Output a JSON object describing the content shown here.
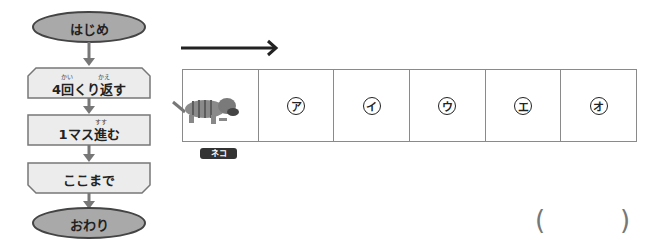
{
  "flowchart": {
    "start": "はじめ",
    "loop_start": {
      "label": "4回くり返す",
      "ruby": [
        "かい",
        "かえ"
      ]
    },
    "step": {
      "label": "1マス進む",
      "ruby": [
        "すす"
      ]
    },
    "loop_end": "ここまで",
    "end": "おわり"
  },
  "board": {
    "direction": "right-arrow",
    "cells": [
      {
        "label": "",
        "content": "cat-character"
      },
      {
        "label": "ア"
      },
      {
        "label": "イ"
      },
      {
        "label": "ウ"
      },
      {
        "label": "エ"
      },
      {
        "label": "オ"
      }
    ],
    "character_label": "ネコ"
  },
  "answer": {
    "open": "(",
    "close": ")",
    "value": ""
  },
  "colors": {
    "terminal_fill": "#a9a9a9",
    "process_fill": "#ececec",
    "stroke": "#555555",
    "arrow": "#777777"
  }
}
